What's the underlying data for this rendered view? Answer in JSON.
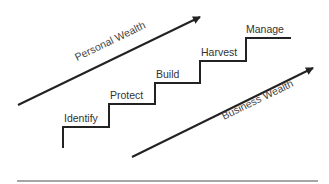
{
  "diagram": {
    "type": "staircase-with-arrows",
    "steps": [
      {
        "label": "Identify"
      },
      {
        "label": "Protect"
      },
      {
        "label": "Build"
      },
      {
        "label": "Harvest"
      },
      {
        "label": "Manage"
      }
    ],
    "arrows": [
      {
        "label": "Personal Wealth",
        "position": "upper-left"
      },
      {
        "label": "Business Wealth",
        "position": "lower-right"
      }
    ],
    "colors": {
      "line": "#222222",
      "text": "#333333",
      "baseline": "#888888",
      "background": "#ffffff"
    }
  }
}
